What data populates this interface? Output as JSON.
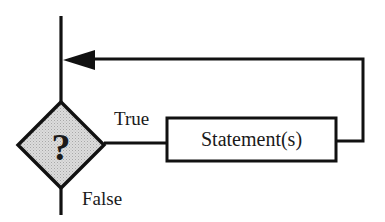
{
  "diagram": {
    "type": "flowchart",
    "decision": {
      "symbol": "?",
      "fill": "#d4d4d4"
    },
    "statement_box": {
      "label": "Statement(s)"
    },
    "edges": {
      "true_label": "True",
      "false_label": "False"
    },
    "colors": {
      "stroke": "#111111",
      "text": "#1a1a1a",
      "background": "#ffffff"
    }
  }
}
